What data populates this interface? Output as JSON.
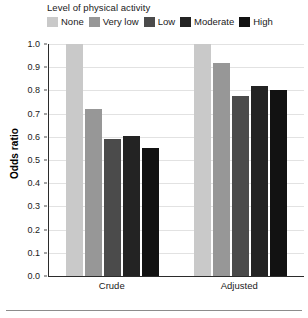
{
  "legend": {
    "title": "Level of physical activity",
    "items": [
      {
        "label": "None",
        "color": "#c9c9c9"
      },
      {
        "label": "Very low",
        "color": "#979797"
      },
      {
        "label": "Low",
        "color": "#4b4b4b"
      },
      {
        "label": "Moderate",
        "color": "#232323"
      },
      {
        "label": "High",
        "color": "#121212"
      }
    ]
  },
  "axes": {
    "y_title": "Odds ratio",
    "y_ticks": [
      "1.0",
      "0.9",
      "0.8",
      "0.7",
      "0.6",
      "0.5",
      "0.4",
      "0.3",
      "0.2",
      "0.1",
      "0.0"
    ],
    "x_ticks": [
      "Crude",
      "Adjusted"
    ]
  },
  "chart_data": {
    "type": "bar",
    "title": "",
    "subtitle": "",
    "xlabel": "",
    "ylabel": "Odds ratio",
    "ylim": [
      0.0,
      1.0
    ],
    "ytick_step": 0.1,
    "grid": true,
    "legend_position": "top",
    "legend_title": "Level of physical activity",
    "categories": [
      "Crude",
      "Adjusted"
    ],
    "series": [
      {
        "name": "None",
        "color": "#c9c9c9",
        "values": [
          1.0,
          1.0
        ]
      },
      {
        "name": "Very low",
        "color": "#979797",
        "values": [
          0.72,
          0.92
        ]
      },
      {
        "name": "Low",
        "color": "#4b4b4b",
        "values": [
          0.59,
          0.775
        ]
      },
      {
        "name": "Moderate",
        "color": "#232323",
        "values": [
          0.605,
          0.82
        ]
      },
      {
        "name": "High",
        "color": "#121212",
        "values": [
          0.55,
          0.8
        ]
      }
    ]
  }
}
